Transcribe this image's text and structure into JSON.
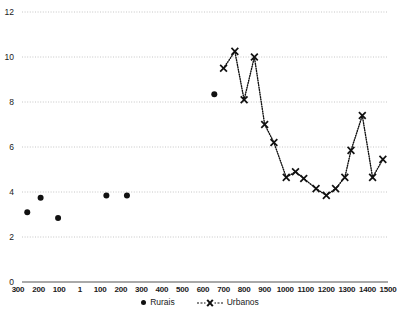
{
  "chart_data": {
    "type": "scatter",
    "title": "",
    "subtitle": "",
    "xlabel": "",
    "ylabel": "",
    "grid": true,
    "legend_position": "bottom-center",
    "ylim": [
      0,
      12
    ],
    "yticks": [
      0,
      2,
      4,
      6,
      8,
      10,
      12
    ],
    "ytick_labels": [
      "0",
      "2",
      "4",
      "6",
      "8",
      "10",
      "12"
    ],
    "xlim": [
      -300,
      1500
    ],
    "xticks": [
      -300,
      -200,
      -100,
      1,
      100,
      200,
      300,
      400,
      500,
      600,
      700,
      800,
      900,
      1000,
      1100,
      1200,
      1300,
      1400,
      1500
    ],
    "xtick_labels": [
      "300",
      "200",
      "100",
      "1",
      "100",
      "200",
      "300",
      "400",
      "500",
      "600",
      "700",
      "800",
      "900",
      "1000",
      "1100",
      "1200",
      "1300",
      "1400",
      "1500"
    ],
    "series": [
      {
        "name": "Rurais",
        "marker": "filled-circle",
        "color": "#111111",
        "line": "none",
        "points": [
          {
            "x": -255,
            "y": 3.1
          },
          {
            "x": -190,
            "y": 3.75
          },
          {
            "x": -105,
            "y": 2.85
          },
          {
            "x": 130,
            "y": 3.85
          },
          {
            "x": 230,
            "y": 3.85
          },
          {
            "x": 655,
            "y": 8.35
          }
        ]
      },
      {
        "name": "Urbanos",
        "marker": "x-cross",
        "color": "#111111",
        "line": "dotted",
        "points": [
          {
            "x": 700,
            "y": 9.5
          },
          {
            "x": 755,
            "y": 10.25
          },
          {
            "x": 800,
            "y": 8.1
          },
          {
            "x": 850,
            "y": 10.0
          },
          {
            "x": 900,
            "y": 7.0
          },
          {
            "x": 945,
            "y": 6.2
          },
          {
            "x": 1005,
            "y": 4.65
          },
          {
            "x": 1050,
            "y": 4.9
          },
          {
            "x": 1090,
            "y": 4.6
          },
          {
            "x": 1150,
            "y": 4.15
          },
          {
            "x": 1200,
            "y": 3.85
          },
          {
            "x": 1245,
            "y": 4.15
          },
          {
            "x": 1290,
            "y": 4.65
          },
          {
            "x": 1320,
            "y": 5.85
          },
          {
            "x": 1375,
            "y": 7.4
          },
          {
            "x": 1425,
            "y": 4.65
          },
          {
            "x": 1475,
            "y": 5.45
          }
        ]
      }
    ]
  },
  "legend": {
    "rurais_label": "Rurais",
    "urbanos_label": "Urbanos"
  },
  "colors": {
    "marker": "#111111",
    "grid": "#b8b8b8",
    "axis": "#555555",
    "text": "#1a1a1a"
  }
}
